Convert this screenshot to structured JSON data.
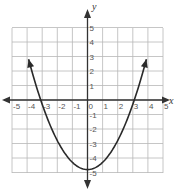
{
  "chart_data": {
    "type": "line",
    "title": "",
    "xlabel": "x",
    "ylabel": "y",
    "xlim": [
      -5,
      5
    ],
    "ylim": [
      -5,
      5
    ],
    "grid": true,
    "x_ticks": [
      "-5",
      "-4",
      "-3",
      "-2",
      "-1",
      "0",
      "1",
      "2",
      "3",
      "4",
      "5"
    ],
    "y_ticks": [
      "5",
      "4",
      "3",
      "2",
      "1",
      "-1",
      "-2",
      "-3",
      "-4",
      "-5"
    ],
    "series": [
      {
        "name": "parabola",
        "equation": "y = 0.5x^2 - 4.8",
        "x": [
          -3.9,
          -3.5,
          -3,
          -2.5,
          -2,
          -1.5,
          -1,
          -0.5,
          0,
          0.5,
          1,
          1.5,
          2,
          2.5,
          3,
          3.5,
          3.9
        ],
        "y": [
          2.8,
          1.3,
          -0.3,
          -1.7,
          -2.8,
          -3.7,
          -4.3,
          -4.7,
          -4.8,
          -4.7,
          -4.3,
          -3.7,
          -2.8,
          -1.7,
          -0.3,
          1.3,
          2.8
        ],
        "vertex": [
          0,
          -4.8
        ],
        "x_intercepts": [
          -3.1,
          3.1
        ],
        "arrows_both_ends": true
      }
    ]
  },
  "colors": {
    "grid": "#b8b8b8",
    "axis": "#333333",
    "curve": "#2a2a2a",
    "tick_text": "#555555"
  }
}
